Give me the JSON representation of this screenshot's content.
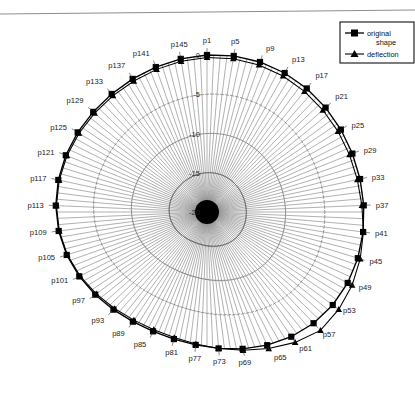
{
  "figure": {
    "title": "",
    "background": "#ffffff",
    "scan_edge_visible": true
  },
  "legend": {
    "position": "top-right",
    "entries": [
      {
        "label_line1": "original",
        "label_line2": "shape",
        "marker": "square-marker",
        "color": "#000000"
      },
      {
        "label_line1": "deflection",
        "label_line2": "",
        "marker": "triangle-marker",
        "color": "#000000"
      }
    ]
  },
  "radial_axis": {
    "tick_labels": [
      "0",
      "-5",
      "-10",
      "-15",
      "-20"
    ],
    "tick_values": [
      0,
      -5,
      -10,
      -15,
      -20
    ],
    "label_angle_deg": 90,
    "direction": "outer-to-center"
  },
  "chart_data": {
    "type": "line",
    "subtype": "polar-radar",
    "title": "",
    "xlabel": "",
    "ylabel": "",
    "grid": false,
    "legend_position": "top-right",
    "rlim": [
      -20,
      0
    ],
    "rticks": [
      0,
      -5,
      -10,
      -15,
      -20
    ],
    "rtick_labels": [
      "0",
      "-5",
      "-10",
      "-15",
      "-20"
    ],
    "n_spokes": 148,
    "label_step": 4,
    "categories": [
      "p1",
      "p5",
      "p9",
      "p13",
      "p17",
      "p21",
      "p25",
      "p29",
      "p33",
      "p37",
      "p41",
      "p45",
      "p49",
      "p53",
      "p57",
      "p61",
      "p65",
      "p69",
      "p73",
      "p77",
      "p81",
      "p85",
      "p89",
      "p93",
      "p97",
      "p101",
      "p105",
      "p109",
      "p113",
      "p117",
      "p121",
      "p125",
      "p129",
      "p133",
      "p137",
      "p141",
      "p145"
    ],
    "series": [
      {
        "name": "original shape",
        "marker": "square",
        "values": [
          0.0,
          0.0,
          0.0,
          0.0,
          0.0,
          0.0,
          0.0,
          0.0,
          0.0,
          0.0,
          0.0,
          0.0,
          0.0,
          0.0,
          0.0,
          0.0,
          0.0,
          0.0,
          0.0,
          0.0,
          0.0,
          0.0,
          0.0,
          0.0,
          0.0,
          0.0,
          0.0,
          0.0,
          0.0,
          0.0,
          0.0,
          0.0,
          0.0,
          0.0,
          0.0,
          0.0,
          0.0
        ]
      },
      {
        "name": "deflection",
        "marker": "triangle",
        "values": [
          -0.8,
          -0.9,
          -1.0,
          -1.1,
          -1.2,
          -1.2,
          -1.1,
          -1.0,
          -0.9,
          -0.6,
          0.1,
          0.8,
          1.6,
          2.4,
          3.2,
          2.2,
          1.2,
          0.5,
          0.0,
          -0.3,
          -0.5,
          -0.6,
          -0.6,
          -0.5,
          -0.4,
          -0.3,
          -0.2,
          -0.2,
          -0.2,
          -0.3,
          -0.4,
          -0.5,
          -0.6,
          -0.7,
          -0.8,
          -0.8,
          -0.8
        ]
      }
    ]
  }
}
